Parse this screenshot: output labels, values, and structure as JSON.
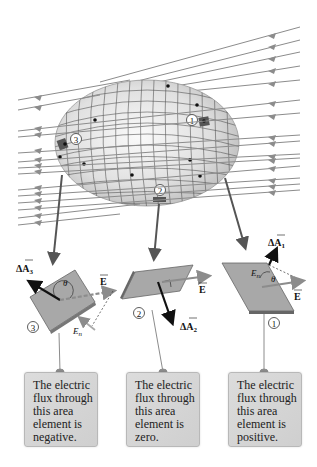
{
  "figure": {
    "type": "gauss-law-closed-surface-flux-diagram",
    "field_color": "#8c8c8c",
    "surface_fill": "#e6e6e6",
    "element_fill": "#a8a8a8",
    "labels": {
      "element_1": "1",
      "element_2": "2",
      "element_3": "3"
    },
    "vectors": {
      "field": "E",
      "area_1": "ΔA",
      "area_1_sub": "1",
      "area_2": "ΔA",
      "area_2_sub": "2",
      "area_3": "ΔA",
      "area_3_sub": "3",
      "normal_component": "E",
      "normal_component_sub": "n",
      "angle": "θ"
    }
  },
  "callouts": [
    {
      "id": "element-3",
      "lines": [
        "The electric",
        "flux through",
        "this area",
        "element is",
        "negative."
      ]
    },
    {
      "id": "element-2",
      "lines": [
        "The electric",
        "flux through",
        "this area",
        "element is",
        "zero."
      ]
    },
    {
      "id": "element-1",
      "lines": [
        "The electric",
        "flux through",
        "this area",
        "element is",
        "positive."
      ]
    }
  ]
}
